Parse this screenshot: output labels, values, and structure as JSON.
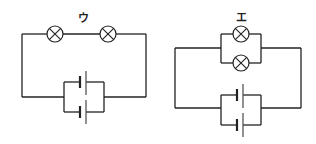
{
  "diagram": {
    "type": "circuit-diagrams",
    "circuits": [
      {
        "label": "ウ",
        "description": "Two bulbs in series, two cells in parallel",
        "bulbs": 2,
        "bulb_arrangement": "series",
        "cells": 2,
        "cell_arrangement": "parallel"
      },
      {
        "label": "エ",
        "description": "Two bulbs in parallel, two cells in parallel",
        "bulbs": 2,
        "bulb_arrangement": "parallel",
        "cells": 2,
        "cell_arrangement": "parallel"
      }
    ],
    "colors": {
      "line": "#222222",
      "background": "#ffffff"
    }
  }
}
